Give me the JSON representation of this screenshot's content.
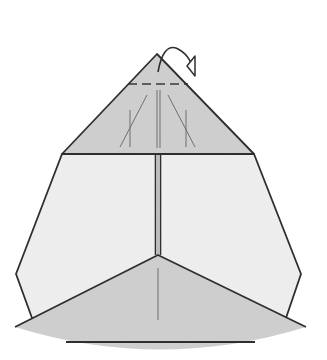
{
  "diagram": {
    "type": "origami-folding-step",
    "colors": {
      "background": "#ffffff",
      "light_paper": "#efefef",
      "shaded_paper": "#cfcfcf",
      "outline": "#2f2f2f",
      "crease": "#6f6f6f"
    },
    "parts": {
      "top_flap": {
        "shape": "triangle",
        "shade": "shaded",
        "points": [
          [
            157,
            54
          ],
          [
            62,
            154
          ],
          [
            254,
            154
          ]
        ]
      },
      "body": {
        "shape": "hexagon",
        "shade": "light",
        "points": [
          [
            62,
            154
          ],
          [
            254,
            154
          ],
          [
            301,
            274
          ],
          [
            286,
            318
          ],
          [
            32,
            318
          ],
          [
            16,
            274
          ]
        ]
      },
      "center_seam": {
        "x": 158,
        "y_from": 154,
        "y_to": 255
      },
      "bottom_flap": {
        "shape": "curved-triangle",
        "shade": "shaded",
        "apex": [
          158,
          255
        ],
        "left": [
          15,
          327
        ],
        "right": [
          306,
          327
        ],
        "bottom_y": 351
      },
      "bottom_edge_line": {
        "x_from": 66,
        "x_to": 255,
        "y": 342
      },
      "hidden_line": {
        "y": 85,
        "x_from": 128,
        "x_to": 188
      }
    },
    "arrow": {
      "type": "mountain-fold-arrow",
      "direction": "behind",
      "start": [
        158,
        72
      ],
      "end": [
        195,
        70
      ]
    }
  }
}
